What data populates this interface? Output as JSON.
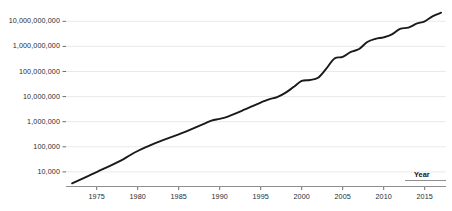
{
  "chart_data": {
    "type": "line",
    "title": "",
    "subtitle": "",
    "xlabel": "Year",
    "ylabel": "",
    "yscale": "log",
    "xscale": "linear",
    "grid": "horizontal",
    "legend": "none",
    "xlim": [
      1972,
      2017.5
    ],
    "ylim": [
      3000,
      30000000000
    ],
    "xticks": [
      1975,
      1980,
      1985,
      1990,
      1995,
      2000,
      2005,
      2010,
      2015
    ],
    "xtick_labels": [
      "1975",
      "1980",
      "1985",
      "1990",
      "1995",
      "2000",
      "2005",
      "2010",
      "2015"
    ],
    "yticks": [
      10000,
      100000,
      1000000,
      10000000,
      100000000,
      1000000000,
      10000000000
    ],
    "ytick_labels": [
      "10,000",
      "100,000",
      "1,000,000",
      "10,000,000",
      "100,000,000",
      "1,000,000,000",
      "10,000,000,000"
    ],
    "series": [
      {
        "name": "count",
        "color": "#1a1a1a",
        "x": [
          1972,
          1974,
          1976,
          1978,
          1979,
          1980,
          1982,
          1983,
          1985,
          1986,
          1988,
          1989,
          1990,
          1991,
          1993,
          1994,
          1995,
          1996,
          1997,
          1998,
          1999,
          2000,
          2001,
          2002,
          2003,
          2004,
          2005,
          2006,
          2007,
          2008,
          2009,
          2010,
          2011,
          2012,
          2013,
          2014,
          2015,
          2016,
          2017
        ],
        "y": [
          3500,
          7000,
          14000,
          29000,
          45000,
          68000,
          134000,
          180000,
          310000,
          420000,
          800000,
          1100000,
          1300000,
          1600000,
          3000000,
          4200000,
          5800000,
          7800000,
          9500000,
          14000000,
          24000000,
          42000000,
          46000000,
          56000000,
          130000000,
          330000000,
          380000000,
          600000000,
          790000000,
          1500000000,
          2000000000,
          2300000000,
          3000000000,
          5000000000,
          5600000000,
          8000000000,
          10000000000,
          16000000000,
          22000000000
        ]
      }
    ],
    "annotations": []
  },
  "axis": {
    "x_axis_title": "Year"
  }
}
